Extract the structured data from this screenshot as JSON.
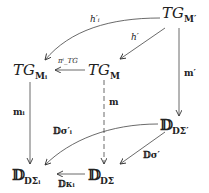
{
  "diagram": {
    "type": "commutative-diagram",
    "nodes": [
      {
        "id": "TGMp",
        "main": "TG",
        "sub": "M′"
      },
      {
        "id": "TGMi",
        "main": "TG",
        "sub": "Mᵢ"
      },
      {
        "id": "TGM",
        "main": "TG",
        "sub": "M"
      },
      {
        "id": "DDSp",
        "main": "𝔻",
        "sub": "DΣ′"
      },
      {
        "id": "DDSi",
        "main": "𝔻",
        "sub": "DΣᵢ"
      },
      {
        "id": "DDS",
        "main": "𝔻",
        "sub": "DΣ"
      }
    ],
    "edges": [
      {
        "from": "TGMp",
        "to": "TGMi",
        "label": "h′ᵢ",
        "style": "curved"
      },
      {
        "from": "TGMp",
        "to": "TGM",
        "label": "h′",
        "style": "solid"
      },
      {
        "from": "TGM",
        "to": "TGMi",
        "label": "πⁱ_TG",
        "style": "solid"
      },
      {
        "from": "TGMp",
        "to": "DDSp",
        "label": "m′",
        "style": "solid"
      },
      {
        "from": "TGMi",
        "to": "DDSi",
        "label": "mᵢ",
        "style": "solid"
      },
      {
        "from": "TGM",
        "to": "DDS",
        "label": "m",
        "style": "dashed"
      },
      {
        "from": "DDSp",
        "to": "DDSi",
        "label": "𝔻σ′ᵢ",
        "style": "curved"
      },
      {
        "from": "DDSp",
        "to": "DDS",
        "label": "𝔻σ′",
        "style": "solid"
      },
      {
        "from": "DDS",
        "to": "DDSi",
        "label": "𝔻κᵢ",
        "style": "solid"
      }
    ]
  }
}
